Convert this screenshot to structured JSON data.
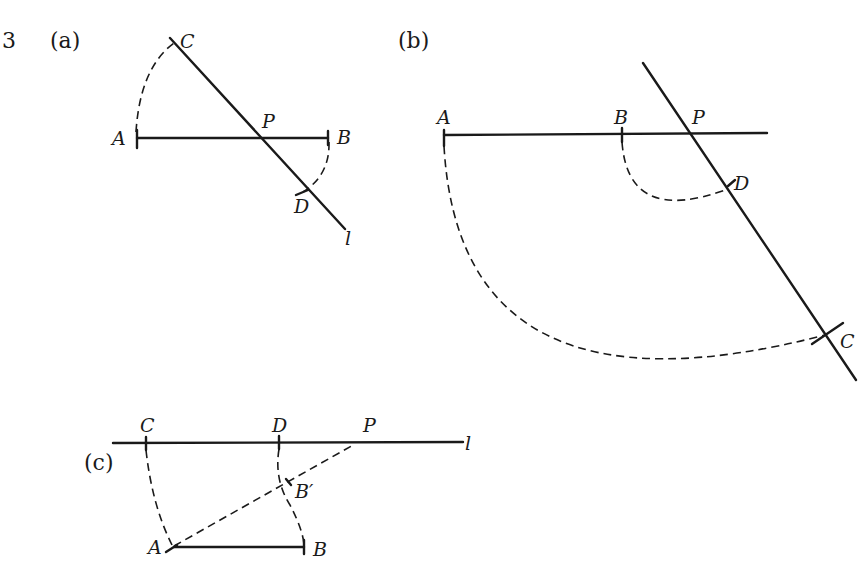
{
  "question_number": "3",
  "parts": {
    "a": {
      "label": "(a)",
      "points": {
        "A": "A",
        "B": "B",
        "C": "C",
        "D": "D",
        "P": "P",
        "l": "l"
      }
    },
    "b": {
      "label": "(b)",
      "points": {
        "A": "A",
        "B": "B",
        "C": "C",
        "D": "D",
        "P": "P"
      }
    },
    "c": {
      "label": "(c)",
      "points": {
        "A": "A",
        "B": "B",
        "B_prime": "B′",
        "C": "C",
        "D": "D",
        "P": "P",
        "l": "l"
      }
    }
  }
}
